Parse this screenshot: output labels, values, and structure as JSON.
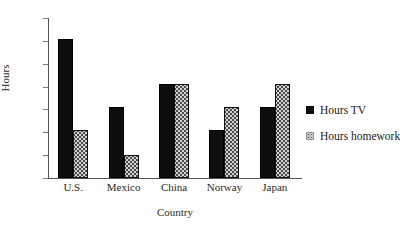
{
  "chart_data": {
    "type": "bar",
    "title": "",
    "xlabel": "Country",
    "ylabel": "Hours",
    "categories": [
      "U.S.",
      "Mexico",
      "China",
      "Norway",
      "Japan"
    ],
    "series": [
      {
        "name": "Hours TV",
        "values": [
          6.1,
          3.1,
          4.1,
          2.1,
          3.1
        ]
      },
      {
        "name": "Hours homework",
        "values": [
          2.1,
          1.0,
          4.1,
          3.1,
          4.1
        ]
      }
    ],
    "ylim": [
      0,
      7
    ],
    "yticks": [
      0,
      1,
      2,
      3,
      4,
      5,
      6,
      7
    ],
    "ytick_labels": [
      "0",
      "1",
      "2",
      "3",
      "4",
      "5",
      "6",
      "7"
    ],
    "grid": false,
    "legend_position": "right",
    "colors": {
      "series_tv": "#0e0e0e",
      "series_homework": "#d2d2d2",
      "axis": "#555555",
      "text": "#1a1a1a",
      "background": "#ffffff"
    }
  },
  "legend": {
    "entries": [
      {
        "label": "Hours TV",
        "icon": "filled-square-icon"
      },
      {
        "label": "Hours homework",
        "icon": "dotted-square-icon"
      }
    ]
  }
}
